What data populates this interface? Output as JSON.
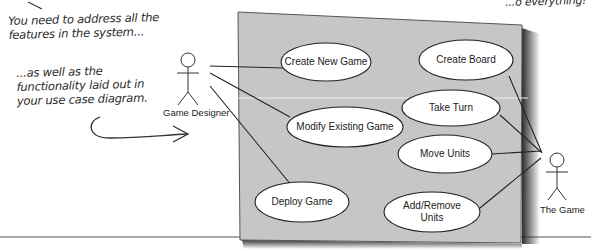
{
  "annotations": {
    "top_right_fragment": "...o everything!",
    "note_features": "You need to address all the\nfeatures in the system...",
    "note_functionality": "...as well as the\nfunctionality laid out in\nyour use case diagram."
  },
  "actors": {
    "designer": {
      "label": "Game Designer"
    },
    "game": {
      "label": "The Game"
    }
  },
  "use_cases": [
    {
      "id": "create-new-game",
      "label": "Create New Game"
    },
    {
      "id": "create-board",
      "label": "Create Board"
    },
    {
      "id": "take-turn",
      "label": "Take Turn"
    },
    {
      "id": "modify-existing-game",
      "label": "Modify Existing Game"
    },
    {
      "id": "move-units",
      "label": "Move Units"
    },
    {
      "id": "deploy-game",
      "label": "Deploy Game"
    },
    {
      "id": "add-remove-units",
      "label": "Add/Remove\nUnits"
    }
  ],
  "colors": {
    "system_box": "#c6c6c6",
    "shadow": "#3a3a3a",
    "ellipse_fill": "#ffffff",
    "stroke": "#222222"
  }
}
